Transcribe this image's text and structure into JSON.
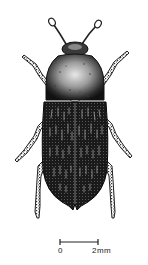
{
  "figure": {
    "style": "pen-and-ink stipple",
    "colors": {
      "ink": "#111111",
      "paper": "#ffffff",
      "highlight": "#d8d8d8"
    }
  },
  "scale_bar": {
    "start_label": "0",
    "end_label": "2mm"
  }
}
